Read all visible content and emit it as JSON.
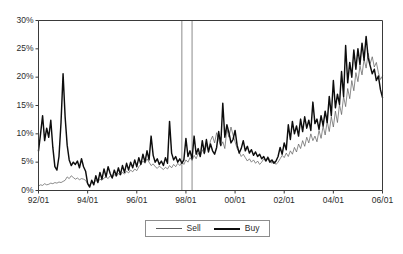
{
  "chart_data": {
    "type": "line",
    "title": "",
    "xlabel": "",
    "ylabel": "",
    "ylim": [
      0,
      30
    ],
    "ytick_labels": [
      "0%",
      "5%",
      "10%",
      "15%",
      "20%",
      "25%",
      "30%"
    ],
    "ytick_values": [
      0,
      5,
      10,
      15,
      20,
      25,
      30
    ],
    "xtick_labels": [
      "92/01",
      "94/01",
      "96/01",
      "98/01",
      "00/01",
      "02/01",
      "04/01",
      "06/01"
    ],
    "xtick_values": [
      0,
      24,
      48,
      72,
      96,
      120,
      144,
      168
    ],
    "xlim": [
      0,
      168
    ],
    "grid": false,
    "legend_position": "bottom-center",
    "annotations": [
      {
        "name": "vertical-marker-1",
        "type": "vline",
        "x": 70,
        "color": "#9a9a9a"
      },
      {
        "name": "vertical-marker-2",
        "type": "vline",
        "x": 75,
        "color": "#9a9a9a"
      }
    ],
    "series": [
      {
        "name": "Sell",
        "color": "#5a5a5a",
        "line_width": "thin",
        "values": [
          0.8,
          1.0,
          0.9,
          1.2,
          1.0,
          1.1,
          1.3,
          1.2,
          1.4,
          1.3,
          1.5,
          1.4,
          1.6,
          1.8,
          2.4,
          2.1,
          2.6,
          2.3,
          2.0,
          2.2,
          1.9,
          2.1,
          2.0,
          1.8,
          1.2,
          1.0,
          1.4,
          1.3,
          1.8,
          1.5,
          2.0,
          1.8,
          2.2,
          2.4,
          2.1,
          2.6,
          2.3,
          2.8,
          2.5,
          3.0,
          2.7,
          3.2,
          2.9,
          3.4,
          3.1,
          3.6,
          3.3,
          3.8,
          3.5,
          4.2,
          4.6,
          5.2,
          4.8,
          5.6,
          5.0,
          4.4,
          4.7,
          4.2,
          3.9,
          4.3,
          4.0,
          3.7,
          4.1,
          3.8,
          4.4,
          4.0,
          4.6,
          4.2,
          4.8,
          4.4,
          5.0,
          4.6,
          5.4,
          5.0,
          5.8,
          5.3,
          6.2,
          5.6,
          6.6,
          6.0,
          7.2,
          6.4,
          8.0,
          7.0,
          8.8,
          9.6,
          8.4,
          10.2,
          9.0,
          7.8,
          8.6,
          7.4,
          10.8,
          9.4,
          11.2,
          9.8,
          8.6,
          7.4,
          6.8,
          6.0,
          6.4,
          5.8,
          5.2,
          5.6,
          5.0,
          5.4,
          4.8,
          5.2,
          4.6,
          5.0,
          5.6,
          5.2,
          6.0,
          5.4,
          4.8,
          5.2,
          4.6,
          5.0,
          5.6,
          6.2,
          5.8,
          6.6,
          6.0,
          7.0,
          6.4,
          7.6,
          6.8,
          8.2,
          7.4,
          8.8,
          7.8,
          9.4,
          8.4,
          10.0,
          8.8,
          9.6,
          8.6,
          10.6,
          9.2,
          11.4,
          9.8,
          12.2,
          10.4,
          13.0,
          11.2,
          14.0,
          12.0,
          15.2,
          13.4,
          16.6,
          14.8,
          18.0,
          16.2,
          19.4,
          17.6,
          20.8,
          19.2,
          22.0,
          20.4,
          23.2,
          21.6,
          24.2,
          22.4,
          23.6,
          21.8,
          22.6,
          20.8,
          19.6,
          20.2
        ]
      },
      {
        "name": "Buy",
        "color": "#0d0d0d",
        "line_width": "thick",
        "values": [
          7.0,
          10.0,
          13.2,
          8.8,
          11.0,
          9.4,
          12.4,
          7.6,
          4.2,
          3.6,
          6.0,
          12.0,
          20.6,
          13.0,
          8.0,
          5.4,
          4.4,
          5.0,
          4.6,
          5.2,
          4.0,
          5.6,
          4.2,
          3.4,
          1.2,
          0.6,
          1.8,
          1.0,
          2.6,
          1.4,
          3.2,
          2.0,
          3.8,
          2.4,
          4.2,
          3.0,
          2.2,
          3.6,
          2.6,
          4.0,
          2.8,
          4.4,
          3.2,
          4.8,
          3.6,
          5.0,
          4.0,
          5.4,
          4.2,
          5.8,
          4.6,
          6.4,
          5.0,
          7.0,
          5.4,
          9.6,
          6.2,
          5.0,
          5.6,
          4.6,
          5.2,
          4.4,
          5.8,
          4.8,
          12.2,
          6.6,
          5.4,
          6.0,
          5.0,
          5.6,
          4.8,
          5.4,
          9.2,
          6.0,
          7.0,
          5.6,
          9.6,
          6.4,
          7.4,
          6.0,
          8.8,
          6.6,
          9.0,
          6.8,
          8.2,
          7.0,
          6.4,
          7.6,
          10.4,
          8.0,
          15.4,
          9.4,
          11.6,
          10.2,
          8.4,
          9.0,
          10.6,
          8.0,
          6.6,
          7.4,
          8.8,
          7.0,
          7.8,
          6.6,
          7.2,
          6.2,
          6.8,
          6.0,
          6.4,
          5.6,
          6.0,
          5.2,
          5.8,
          5.0,
          5.4,
          4.8,
          5.2,
          6.0,
          7.6,
          6.4,
          8.4,
          7.2,
          11.6,
          9.0,
          12.2,
          10.0,
          11.4,
          9.6,
          12.6,
          10.4,
          13.0,
          11.0,
          12.4,
          10.6,
          15.6,
          11.8,
          12.6,
          10.8,
          13.2,
          11.4,
          14.0,
          12.0,
          16.6,
          13.2,
          19.4,
          14.6,
          17.0,
          15.2,
          21.0,
          16.6,
          25.6,
          19.0,
          22.6,
          20.0,
          24.8,
          21.4,
          25.0,
          22.2,
          26.0,
          23.0,
          27.2,
          23.4,
          22.0,
          20.6,
          21.4,
          19.4,
          20.2,
          17.8,
          16.4
        ]
      }
    ]
  },
  "legend": {
    "sell_label": "Sell",
    "buy_label": "Buy"
  }
}
